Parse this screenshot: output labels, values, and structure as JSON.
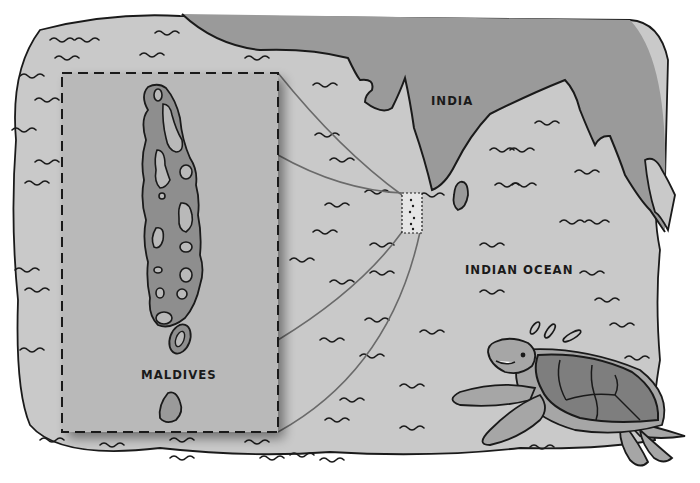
{
  "map": {
    "labels": {
      "india": "INDIA",
      "ocean": "INDIAN OCEAN",
      "inset": "MALDIVES"
    },
    "colors": {
      "background": "#ffffff",
      "ocean": "#c9c9c9",
      "land": "#9a9a9a",
      "inset_water": "#b9b9b9",
      "atoll_fill": "#8e8e8e",
      "outline": "#1a1a1a",
      "leader_line": "#6a6a6a",
      "turtle_shell": "#7e7e7e",
      "turtle_skin": "#a6a6a6"
    },
    "inset": {
      "title": "MALDIVES",
      "style": "dashed-border"
    },
    "decorations": {
      "character": "sea-turtle"
    }
  }
}
